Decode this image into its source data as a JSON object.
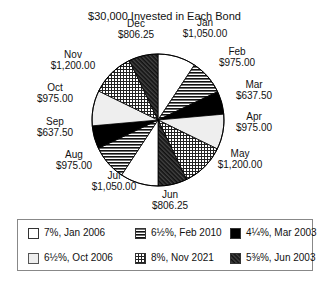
{
  "chart_data": {
    "type": "pie",
    "title": "$30,000 Invested in Each Bond",
    "categories": [
      "Jan",
      "Feb",
      "Mar",
      "Apr",
      "May",
      "Jun",
      "Jul",
      "Aug",
      "Sep",
      "Oct",
      "Nov",
      "Dec"
    ],
    "values": [
      1050.0,
      975.0,
      637.5,
      975.0,
      1200.0,
      806.25,
      1050.0,
      975.0,
      637.5,
      975.0,
      1200.0,
      806.25
    ],
    "value_labels": [
      "$1,050.00",
      "$975.00",
      "$637.50",
      "$975.00",
      "$1,200.00",
      "$806.25",
      "$1,050.00",
      "$975.00",
      "$637.50",
      "$975.00",
      "$1,200.00",
      "$806.25"
    ],
    "series_by_slice": [
      "7%, Jan 2006",
      "6½%, Feb 2010",
      "4¼%, Mar 2003",
      "6½%, Oct 2006",
      "8%, Nov 2021",
      "5⅜%, Jun 2003",
      "7%, Jan 2006",
      "6½%, Feb 2010",
      "4¼%, Mar 2003",
      "6½%, Oct 2006",
      "8%, Nov 2021",
      "5⅜%, Jun 2003"
    ],
    "start_angle": "12 o'clock",
    "direction": "clockwise",
    "legend": {
      "position": "bottom",
      "entries": [
        {
          "label": "7%, Jan 2006",
          "pattern": "white"
        },
        {
          "label": "6½%, Feb 2010",
          "pattern": "horizontal-lines"
        },
        {
          "label": "4¼%, Mar 2003",
          "pattern": "black"
        },
        {
          "label": "6½%, Oct 2006",
          "pattern": "light-gray"
        },
        {
          "label": "8%, Nov 2021",
          "pattern": "crosshatch"
        },
        {
          "label": "5⅜%, Jun 2003",
          "pattern": "dark-diagonal"
        }
      ]
    }
  },
  "labels": [
    {
      "month": "Jan",
      "value": "$1,050.00"
    },
    {
      "month": "Feb",
      "value": "$975.00"
    },
    {
      "month": "Mar",
      "value": "$637.50"
    },
    {
      "month": "Apr",
      "value": "$975.00"
    },
    {
      "month": "May",
      "value": "$1,200.00"
    },
    {
      "month": "Jun",
      "value": "$806.25"
    },
    {
      "month": "Jul",
      "value": "$1,050.00"
    },
    {
      "month": "Aug",
      "value": "$975.00"
    },
    {
      "month": "Sep",
      "value": "$637.50"
    },
    {
      "month": "Oct",
      "value": "$975.00"
    },
    {
      "month": "Nov",
      "value": "$1,200.00"
    },
    {
      "month": "Dec",
      "value": "$806.25"
    }
  ]
}
